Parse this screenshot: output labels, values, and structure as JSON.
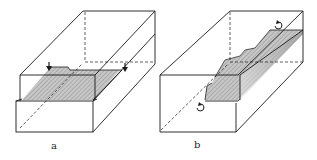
{
  "figure": {
    "panels": [
      {
        "id": "a",
        "label": "a",
        "description": "Box with stepped lower block and shaded planar groove, two arrows marking cut"
      },
      {
        "id": "b",
        "label": "b",
        "description": "Box with shaded stepped ridge along diagonal, two curved rotation arrows"
      }
    ]
  },
  "colors": {
    "stroke": "#1a1a1a",
    "shade": "#bdbdbd",
    "shade_dark": "#9a9a9a",
    "background": "#ffffff"
  }
}
